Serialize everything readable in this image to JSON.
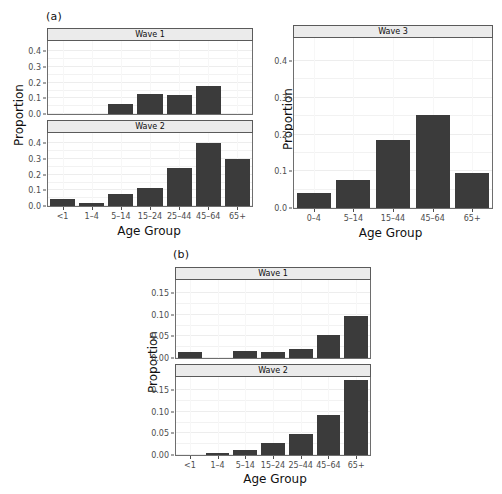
{
  "figure": {
    "background": "#ffffff",
    "bar_color": "#3b3b3b",
    "strip_color": "#ebebeb",
    "axis_text_color": "#4d4d4d",
    "width": 502,
    "height": 494
  },
  "panel_a": {
    "letter": "(a)",
    "ylabel": "Proportion",
    "xlabel": "Age Group"
  },
  "panel_b": {
    "letter": "(b)",
    "ylabel": "Proportion",
    "xlabel": "Age Group"
  },
  "panel_wave3": {
    "ylabel": "Proportion",
    "xlabel": "Age Group"
  },
  "chart_data": [
    {
      "id": "a-wave1",
      "type": "bar",
      "title": "Wave 1",
      "group": "(a)",
      "categories": [
        "<1",
        "1–4",
        "5–14",
        "15–24",
        "25–44",
        "45–64",
        "65+"
      ],
      "values": [
        0.0,
        0.0,
        0.065,
        0.125,
        0.12,
        0.181,
        0.0
      ],
      "xlabel": "Age Group",
      "ylabel": "Proportion",
      "ylim": [
        0.0,
        0.46
      ],
      "yticks": [
        0.0,
        0.1,
        0.2,
        0.3,
        0.4
      ],
      "ytick_labels": [
        "0.0",
        "0.1",
        "0.2",
        "0.3",
        "0.4"
      ],
      "grid": true,
      "legend": "none"
    },
    {
      "id": "a-wave2",
      "type": "bar",
      "title": "Wave 2",
      "group": "(a)",
      "categories": [
        "<1",
        "1–4",
        "5–14",
        "15–24",
        "25–44",
        "45–64",
        "65+"
      ],
      "values": [
        0.048,
        0.02,
        0.078,
        0.115,
        0.246,
        0.405,
        0.301
      ],
      "xlabel": "Age Group",
      "ylabel": "Proportion",
      "ylim": [
        0.0,
        0.46
      ],
      "yticks": [
        0.0,
        0.1,
        0.2,
        0.3,
        0.4
      ],
      "ytick_labels": [
        "0.0",
        "0.1",
        "0.2",
        "0.3",
        "0.4"
      ],
      "grid": true,
      "legend": "none"
    },
    {
      "id": "wave3",
      "type": "bar",
      "title": "Wave 3",
      "group": "standalone",
      "categories": [
        "0–4",
        "5–14",
        "15–44",
        "45–64",
        "65+"
      ],
      "values": [
        0.042,
        0.077,
        0.185,
        0.253,
        0.095
      ],
      "xlabel": "Age Group",
      "ylabel": "Proportion",
      "ylim": [
        0.0,
        0.46
      ],
      "yticks": [
        0.0,
        0.1,
        0.2,
        0.3,
        0.4
      ],
      "ytick_labels": [
        "0.0",
        "0.1",
        "0.2",
        "0.3",
        "0.4"
      ],
      "grid": true,
      "legend": "none"
    },
    {
      "id": "b-wave1",
      "type": "bar",
      "title": "Wave 1",
      "group": "(b)",
      "categories": [
        "<1",
        "1–4",
        "5–14",
        "15–24",
        "25–44",
        "45–64",
        "65+"
      ],
      "values": [
        0.014,
        0.0,
        0.016,
        0.013,
        0.021,
        0.053,
        0.098
      ],
      "xlabel": "Age Group",
      "ylabel": "Proportion",
      "ylim": [
        0.0,
        0.178
      ],
      "yticks": [
        0.0,
        0.05,
        0.1,
        0.15
      ],
      "ytick_labels": [
        "0.00",
        "0.05",
        "0.10",
        "0.15"
      ],
      "grid": true,
      "legend": "none"
    },
    {
      "id": "b-wave2",
      "type": "bar",
      "title": "Wave 2",
      "group": "(b)",
      "categories": [
        "<1",
        "1–4",
        "5–14",
        "15–24",
        "25–44",
        "45–64",
        "65+"
      ],
      "values": [
        0.0,
        0.004,
        0.011,
        0.028,
        0.049,
        0.093,
        0.173
      ],
      "xlabel": "Age Group",
      "ylabel": "Proportion",
      "ylim": [
        0.0,
        0.178
      ],
      "yticks": [
        0.0,
        0.05,
        0.1,
        0.15
      ],
      "ytick_labels": [
        "0.00",
        "0.05",
        "0.10",
        "0.15"
      ],
      "grid": true,
      "legend": "none"
    }
  ]
}
